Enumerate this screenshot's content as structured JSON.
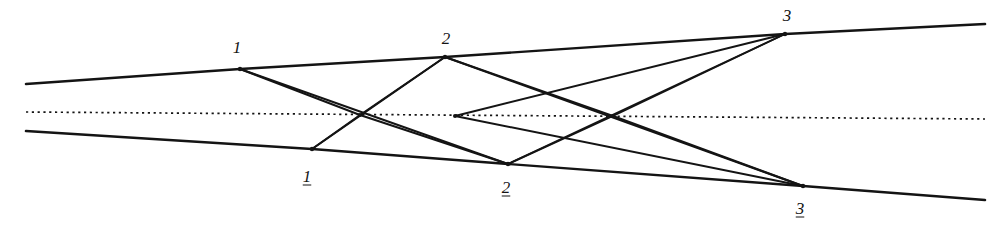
{
  "figure": {
    "width": 1002,
    "height": 228,
    "background_color": "#ffffff",
    "ink_color": "#141414",
    "axis_color": "#141414"
  },
  "axis": {
    "name": "optical-axis",
    "style": "dotted",
    "x1": 26,
    "y1": 112,
    "x2": 985,
    "y2": 119,
    "dash": "2.2 3.6",
    "width": 1.7
  },
  "nodes": [
    {
      "id": "n1",
      "label": "1",
      "underlined": false,
      "x": 240,
      "y": 69,
      "label_x": 237,
      "label_y": 47,
      "dot_r": 2.2
    },
    {
      "id": "n2",
      "label": "2",
      "underlined": false,
      "x": 445,
      "y": 57,
      "label_x": 446,
      "label_y": 38,
      "dot_r": 2.2
    },
    {
      "id": "n3",
      "label": "3",
      "underlined": false,
      "x": 785,
      "y": 34,
      "label_x": 787,
      "label_y": 15,
      "dot_r": 2.2
    },
    {
      "id": "m1",
      "label": "1",
      "underlined": true,
      "x": 312,
      "y": 149,
      "label_x": 307,
      "label_y": 176,
      "dot_r": 2.2
    },
    {
      "id": "m2",
      "label": "2",
      "underlined": true,
      "x": 508,
      "y": 164,
      "label_x": 506,
      "label_y": 187,
      "dot_r": 2.2
    },
    {
      "id": "m3",
      "label": "3",
      "underlined": true,
      "x": 803,
      "y": 186,
      "label_x": 800,
      "label_y": 208,
      "dot_r": 2.2
    },
    {
      "id": "a1",
      "label": "",
      "underlined": false,
      "x": 360,
      "y": 115,
      "label_x": 0,
      "label_y": 0,
      "dot_r": 2.0
    },
    {
      "id": "a2",
      "label": "",
      "underlined": false,
      "x": 455,
      "y": 116,
      "label_x": 0,
      "label_y": 0,
      "dot_r": 2.0
    },
    {
      "id": "a3",
      "label": "",
      "underlined": false,
      "x": 613,
      "y": 116,
      "label_x": 0,
      "label_y": 0,
      "dot_r": 2.0
    }
  ],
  "rays": [
    {
      "name": "upper-incoming-ray",
      "x1": 26,
      "y1": 84,
      "x2": 240,
      "y2": 69,
      "w": 2.6
    },
    {
      "name": "lower-incoming-ray",
      "x1": 26,
      "y1": 131,
      "x2": 312,
      "y2": 149,
      "w": 2.6
    },
    {
      "name": "upper-outgoing-ray",
      "x1": 785,
      "y1": 34,
      "x2": 985,
      "y2": 24,
      "w": 2.6
    },
    {
      "name": "lower-outgoing-ray",
      "x1": 803,
      "y1": 186,
      "x2": 985,
      "y2": 200,
      "w": 2.6
    },
    {
      "name": "ray-n1-to-n2",
      "x1": 240,
      "y1": 69,
      "x2": 445,
      "y2": 57,
      "w": 2.4
    },
    {
      "name": "ray-n2-to-n3",
      "x1": 445,
      "y1": 57,
      "x2": 785,
      "y2": 34,
      "w": 2.4
    },
    {
      "name": "ray-m1-to-m2",
      "x1": 312,
      "y1": 149,
      "x2": 508,
      "y2": 164,
      "w": 2.4
    },
    {
      "name": "ray-m2-to-m3",
      "x1": 508,
      "y1": 164,
      "x2": 803,
      "y2": 186,
      "w": 2.4
    },
    {
      "name": "ray-n1-to-axis-a1",
      "x1": 240,
      "y1": 69,
      "x2": 360,
      "y2": 115,
      "w": 1.9
    },
    {
      "name": "ray-n1-to-m2",
      "x1": 240,
      "y1": 69,
      "x2": 508,
      "y2": 164,
      "w": 1.9
    },
    {
      "name": "ray-m1-to-axis-a1",
      "x1": 312,
      "y1": 149,
      "x2": 360,
      "y2": 115,
      "w": 1.9
    },
    {
      "name": "ray-m1-to-n2",
      "x1": 312,
      "y1": 149,
      "x2": 445,
      "y2": 57,
      "w": 1.9
    },
    {
      "name": "ray-axis-a1-to-n2",
      "x1": 360,
      "y1": 115,
      "x2": 445,
      "y2": 57,
      "w": 1.9
    },
    {
      "name": "ray-axis-a1-to-m2",
      "x1": 360,
      "y1": 115,
      "x2": 508,
      "y2": 164,
      "w": 1.9
    },
    {
      "name": "ray-n2-to-axis-a3",
      "x1": 445,
      "y1": 57,
      "x2": 613,
      "y2": 116,
      "w": 1.9
    },
    {
      "name": "ray-n2-to-m3",
      "x1": 445,
      "y1": 57,
      "x2": 803,
      "y2": 186,
      "w": 1.9
    },
    {
      "name": "ray-m2-to-axis-a3",
      "x1": 508,
      "y1": 164,
      "x2": 613,
      "y2": 116,
      "w": 1.9
    },
    {
      "name": "ray-m2-to-n3",
      "x1": 508,
      "y1": 164,
      "x2": 785,
      "y2": 34,
      "w": 1.9
    },
    {
      "name": "ray-axis-a2-to-n3",
      "x1": 455,
      "y1": 116,
      "x2": 785,
      "y2": 34,
      "w": 1.9
    },
    {
      "name": "ray-axis-a2-to-m3",
      "x1": 455,
      "y1": 116,
      "x2": 803,
      "y2": 186,
      "w": 1.9
    },
    {
      "name": "ray-axis-a3-to-n3",
      "x1": 613,
      "y1": 116,
      "x2": 785,
      "y2": 34,
      "w": 1.9
    },
    {
      "name": "ray-axis-a3-to-m3",
      "x1": 613,
      "y1": 116,
      "x2": 803,
      "y2": 186,
      "w": 1.9
    }
  ]
}
